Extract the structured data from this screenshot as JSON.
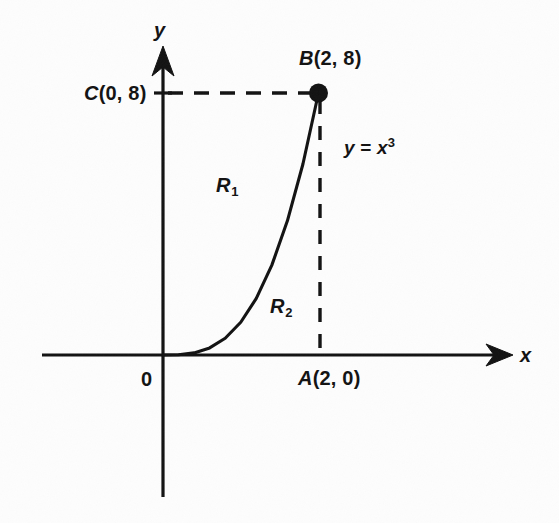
{
  "figure": {
    "background_color": "#fdfdfd",
    "ink_color": "#121212",
    "axes": {
      "x_axis_label": "x",
      "y_axis_label": "y",
      "origin_label": "0"
    },
    "points": [
      {
        "name": "C",
        "label": "C(0, 8)",
        "italic_part": "C",
        "rest": "(0, 8)",
        "x": 0,
        "y": 8
      },
      {
        "name": "B",
        "label": "B(2, 8)",
        "italic_part": "B",
        "rest": "(2, 8)",
        "x": 2,
        "y": 8
      },
      {
        "name": "A",
        "label": "A(2, 0)",
        "italic_part": "A",
        "rest": "(2, 0)",
        "x": 2,
        "y": 0
      }
    ],
    "curve": {
      "equation_lhs": "y",
      "equation_eq": " = ",
      "equation_base": "x",
      "equation_exponent": "3",
      "equation_plain": "y = x^3"
    },
    "regions": [
      {
        "name": "R1",
        "base": "R",
        "sub": "1",
        "description": "region above curve, left of B-C line"
      },
      {
        "name": "R2",
        "base": "R",
        "sub": "2",
        "description": "region below curve, above x-axis"
      }
    ]
  },
  "chart_data": {
    "type": "line",
    "title": "",
    "xlabel": "x",
    "ylabel": "y",
    "grid": false,
    "legend": null,
    "curves": [
      {
        "name": "y = x^3",
        "expression": "x^3",
        "x_domain": [
          0,
          2
        ],
        "y_range": [
          0,
          8
        ],
        "points": [
          [
            0.0,
            0.0
          ],
          [
            0.2,
            0.008
          ],
          [
            0.4,
            0.064
          ],
          [
            0.6,
            0.216
          ],
          [
            0.8,
            0.512
          ],
          [
            1.0,
            1.0
          ],
          [
            1.2,
            1.728
          ],
          [
            1.4,
            2.744
          ],
          [
            1.6,
            4.096
          ],
          [
            1.8,
            5.832
          ],
          [
            2.0,
            8.0
          ]
        ]
      }
    ],
    "marked_points": [
      {
        "label": "A(2, 0)",
        "x": 2,
        "y": 0,
        "marker": "none"
      },
      {
        "label": "B(2, 8)",
        "x": 2,
        "y": 8,
        "marker": "filled-circle"
      },
      {
        "label": "C(0, 8)",
        "x": 0,
        "y": 8,
        "marker": "tick"
      }
    ],
    "dashed_segments": [
      {
        "from": [
          0,
          8
        ],
        "to": [
          2,
          8
        ],
        "note": "C to B horizontal dashed"
      },
      {
        "from": [
          2,
          8
        ],
        "to": [
          2,
          0
        ],
        "note": "B to A vertical dashed"
      }
    ],
    "annotations": [
      {
        "text": "R1",
        "x": 0.72,
        "y": 5.5
      },
      {
        "text": "R2",
        "x": 1.42,
        "y": 1.8
      },
      {
        "text": "y = x^3",
        "x": 2.35,
        "y": 6.65
      }
    ],
    "xlim": [
      -1.56,
      4.48
    ],
    "ylim": [
      -4.27,
      9.44
    ]
  }
}
